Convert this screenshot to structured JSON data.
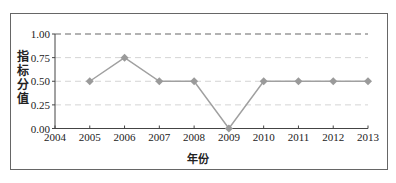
{
  "chart_data": {
    "type": "line",
    "title": "",
    "xlabel": "年份",
    "ylabel": "指标分值",
    "categories": [
      "2005",
      "2006",
      "2007",
      "2008",
      "2009",
      "2010",
      "2011",
      "2012",
      "2013"
    ],
    "series": [
      {
        "name": "指标分值",
        "values": [
          0.5,
          0.75,
          0.5,
          0.5,
          0.0,
          0.5,
          0.5,
          0.5,
          0.5
        ]
      }
    ],
    "x_ticks": [
      "2004",
      "2005",
      "2006",
      "2007",
      "2008",
      "2009",
      "2010",
      "2011",
      "2012",
      "2013"
    ],
    "y_ticks": [
      "0.00",
      "0.25",
      "0.50",
      "0.75",
      "1.00"
    ],
    "xlim": [
      2004,
      2013
    ],
    "ylim": [
      0,
      1
    ],
    "reference_line": {
      "y": 1.0,
      "style": "dashed"
    },
    "grid": {
      "horizontal": true,
      "style": "dashed-light"
    },
    "legend": "none",
    "colors": {
      "line": "#a0a0a0",
      "marker": "#9a9a9a",
      "ref_line": "#666666",
      "grid": "#d4d4d4",
      "axis": "#444444"
    }
  },
  "labels": {
    "ylabel_chars": [
      "指",
      "标",
      "分",
      "值"
    ],
    "xlabel": "年份"
  }
}
